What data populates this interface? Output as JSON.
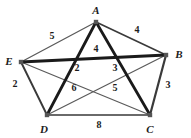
{
  "figure": {
    "background_color": "#ffffff",
    "width": 191,
    "height": 138
  },
  "style": {
    "edge_color_thin": "#5a5a5a",
    "edge_color_medium": "#3a3a3a",
    "edge_color_bold": "#1a1a1a",
    "vertex_color": "#555555",
    "label_color": "#1c1c1c"
  },
  "graph": {
    "type": "weighted-undirected-graph",
    "vertices": [
      {
        "id": "A",
        "label": "A",
        "x": 96,
        "y": 22,
        "label_x": 96,
        "label_y": 10
      },
      {
        "id": "B",
        "label": "B",
        "x": 166,
        "y": 55,
        "label_x": 179,
        "label_y": 54
      },
      {
        "id": "C",
        "label": "C",
        "x": 150,
        "y": 115,
        "label_x": 150,
        "label_y": 129
      },
      {
        "id": "D",
        "label": "D",
        "x": 47,
        "y": 115,
        "label_x": 44,
        "label_y": 129
      },
      {
        "id": "E",
        "label": "E",
        "x": 21,
        "y": 62,
        "label_x": 9,
        "label_y": 61
      }
    ],
    "edges": [
      {
        "from": "A",
        "to": "E",
        "weight": "5",
        "weight_x": 52,
        "weight_y": 36,
        "thickness": 1.3,
        "tone": "thin"
      },
      {
        "from": "A",
        "to": "B",
        "weight": "4",
        "weight_x": 137,
        "weight_y": 30,
        "thickness": 1.6,
        "tone": "medium"
      },
      {
        "from": "E",
        "to": "B",
        "weight": "4",
        "weight_x": 96,
        "weight_y": 49,
        "thickness": 3.0,
        "tone": "bold"
      },
      {
        "from": "A",
        "to": "D",
        "weight": "2",
        "weight_x": 77,
        "weight_y": 68,
        "thickness": 2.8,
        "tone": "bold"
      },
      {
        "from": "A",
        "to": "C",
        "weight": "3",
        "weight_x": 115,
        "weight_y": 68,
        "thickness": 2.8,
        "tone": "bold"
      },
      {
        "from": "E",
        "to": "D",
        "weight": "2",
        "weight_x": 15,
        "weight_y": 84,
        "thickness": 1.9,
        "tone": "medium"
      },
      {
        "from": "B",
        "to": "C",
        "weight": "3",
        "weight_x": 168,
        "weight_y": 85,
        "thickness": 2.2,
        "tone": "medium"
      },
      {
        "from": "E",
        "to": "C",
        "weight": "6",
        "weight_x": 74,
        "weight_y": 88,
        "thickness": 1.2,
        "tone": "thin"
      },
      {
        "from": "D",
        "to": "B",
        "weight": "5",
        "weight_x": 115,
        "weight_y": 88,
        "thickness": 1.2,
        "tone": "thin"
      },
      {
        "from": "D",
        "to": "C",
        "weight": "8",
        "weight_x": 99,
        "weight_y": 125,
        "thickness": 1.6,
        "tone": "medium"
      }
    ]
  }
}
